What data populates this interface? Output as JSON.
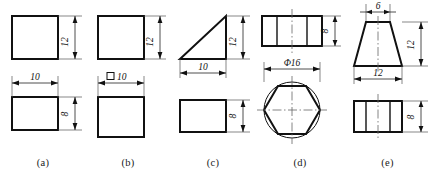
{
  "sheet": {
    "background_color": "#ffffff",
    "line_color": "#111111",
    "thin_line_color": "#555555",
    "width": 431,
    "height": 172,
    "description": "Engineering drawing exercise: five orthographic projection problems labelled (a) through (e)"
  },
  "figures": [
    {
      "id": "a",
      "caption": "(a)",
      "top_view": {
        "shape": "square",
        "dimensions": [
          {
            "name": "height",
            "label": "12",
            "orientation": "vertical",
            "side": "right"
          }
        ]
      },
      "front_view": {
        "shape": "rectangle",
        "dimensions": [
          {
            "name": "width",
            "label": "10",
            "orientation": "horizontal",
            "side": "top"
          },
          {
            "name": "height",
            "label": "8",
            "orientation": "vertical",
            "side": "right"
          }
        ]
      }
    },
    {
      "id": "b",
      "caption": "(b)",
      "top_view": {
        "shape": "square",
        "dimensions": [
          {
            "name": "height",
            "label": "12",
            "orientation": "vertical",
            "side": "right"
          }
        ]
      },
      "front_view": {
        "shape": "square",
        "dimensions": [
          {
            "name": "width",
            "label": "10",
            "prefix_symbol": "square",
            "orientation": "horizontal",
            "side": "top"
          }
        ]
      }
    },
    {
      "id": "c",
      "caption": "(c)",
      "top_view": {
        "shape": "right-triangle",
        "dimensions": [
          {
            "name": "height",
            "label": "12",
            "orientation": "vertical",
            "side": "right"
          },
          {
            "name": "base",
            "label": "10",
            "orientation": "horizontal",
            "side": "bottom"
          }
        ]
      },
      "front_view": {
        "shape": "rectangle",
        "dimensions": [
          {
            "name": "height",
            "label": "8",
            "orientation": "vertical",
            "side": "right"
          }
        ]
      }
    },
    {
      "id": "d",
      "caption": "(d)",
      "top_view": {
        "shape": "rectangle-with-two-vertical-lines",
        "centerline": true,
        "dimensions": [
          {
            "name": "height",
            "label": "8",
            "orientation": "vertical",
            "side": "right"
          }
        ]
      },
      "front_view": {
        "shape": "hexagon-inscribed-in-circle",
        "centerline": true,
        "dimensions": [
          {
            "name": "diameter",
            "label": "Φ16",
            "orientation": "horizontal",
            "side": "top"
          }
        ]
      }
    },
    {
      "id": "e",
      "caption": "(e)",
      "top_view": {
        "shape": "trapezoid",
        "centerline": true,
        "dimensions": [
          {
            "name": "top-width",
            "label": "6",
            "orientation": "horizontal",
            "side": "top"
          },
          {
            "name": "height",
            "label": "12",
            "orientation": "vertical",
            "side": "right"
          },
          {
            "name": "bottom-width",
            "label": "12",
            "orientation": "horizontal",
            "side": "bottom"
          }
        ]
      },
      "front_view": {
        "shape": "rectangle-with-two-vertical-lines",
        "centerline": true,
        "dimensions": [
          {
            "name": "height",
            "label": "8",
            "orientation": "vertical",
            "side": "right"
          }
        ]
      }
    }
  ]
}
